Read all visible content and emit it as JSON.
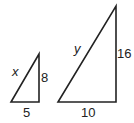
{
  "figure": {
    "small_triangle": {
      "hypotenuse_label": "x",
      "vertical_label": "8",
      "base_label": "5"
    },
    "large_triangle": {
      "hypotenuse_label": "y",
      "vertical_label": "16",
      "base_label": "10"
    },
    "stroke_color": "#222222"
  }
}
